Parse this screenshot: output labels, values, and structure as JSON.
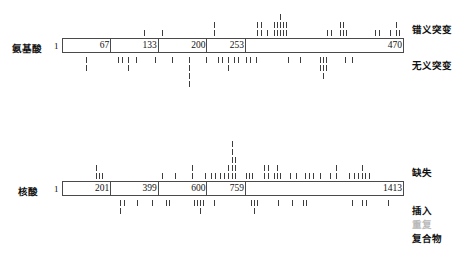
{
  "figure": {
    "title_present": false,
    "rows": [
      {
        "id": "amino-acid",
        "label": "氨基酸",
        "start_label": "1",
        "bar": {
          "x": 62,
          "y": 38,
          "width": 342,
          "height": 15
        },
        "segments": [
          {
            "end_label": "67",
            "width_pct": 14.2
          },
          {
            "end_label": "133",
            "width_pct": 14.0
          },
          {
            "end_label": "200",
            "width_pct": 14.3
          },
          {
            "end_label": "253",
            "width_pct": 11.3
          },
          {
            "end_label": "470",
            "width_pct": 46.2
          }
        ],
        "above_label": "错义突变",
        "below_label": "无义突变"
      },
      {
        "id": "nucleic-acid",
        "label": "核酸",
        "start_label": "1",
        "bar": {
          "x": 62,
          "y": 181,
          "width": 342,
          "height": 15
        },
        "segments": [
          {
            "end_label": "201",
            "width_pct": 14.2
          },
          {
            "end_label": "399",
            "width_pct": 14.0
          },
          {
            "end_label": "600",
            "width_pct": 14.3
          },
          {
            "end_label": "759",
            "width_pct": 11.3
          },
          {
            "end_label": "1413",
            "width_pct": 46.2
          }
        ],
        "above_label": "缺失",
        "below_labels": [
          "插入",
          "重复",
          "复合物"
        ]
      }
    ],
    "legend_right": [
      {
        "text": "错义突变",
        "y": 22,
        "muted": false
      },
      {
        "text": "无义突变",
        "y": 58,
        "muted": false
      },
      {
        "text": "缺失",
        "y": 165,
        "muted": false
      },
      {
        "text": "插入",
        "y": 203,
        "muted": false
      },
      {
        "text": "重复",
        "y": 218,
        "muted": true
      },
      {
        "text": "复合物",
        "y": 233,
        "muted": false
      }
    ],
    "colors": {
      "bar_border": "#4a4a4a",
      "tick": "#3d3d3d",
      "tick_pale": "#9a9a9a",
      "muted_text": "#b9b9b9",
      "text": "#111111",
      "background": "#ffffff"
    }
  },
  "chart_data": {
    "type": "lollipop",
    "title": "",
    "xlabel": "",
    "ylabel": "",
    "tracks": [
      {
        "name": "错义突变",
        "axis": "氨基酸",
        "position": "above",
        "axis_range": [
          1,
          470
        ],
        "ticks": [
          {
            "x": 144,
            "n": 1
          },
          {
            "x": 162,
            "n": 1
          },
          {
            "x": 214,
            "n": 2
          },
          {
            "x": 257,
            "n": 2
          },
          {
            "x": 261,
            "n": 2
          },
          {
            "x": 267,
            "n": 1
          },
          {
            "x": 274,
            "n": 2
          },
          {
            "x": 277,
            "n": 2
          },
          {
            "x": 280,
            "n": 3
          },
          {
            "x": 283,
            "n": 2
          },
          {
            "x": 286,
            "n": 2
          },
          {
            "x": 327,
            "n": 1
          },
          {
            "x": 331,
            "n": 1
          },
          {
            "x": 340,
            "n": 2
          },
          {
            "x": 343,
            "n": 2
          },
          {
            "x": 346,
            "n": 1
          },
          {
            "x": 375,
            "n": 1
          },
          {
            "x": 379,
            "n": 1
          },
          {
            "x": 390,
            "n": 1
          },
          {
            "x": 396,
            "n": 2
          },
          {
            "x": 399,
            "n": 1
          }
        ]
      },
      {
        "name": "无义突变",
        "axis": "氨基酸",
        "position": "below",
        "axis_range": [
          1,
          470
        ],
        "ticks": [
          {
            "x": 86,
            "n": 2
          },
          {
            "x": 118,
            "n": 1
          },
          {
            "x": 122,
            "n": 1
          },
          {
            "x": 128,
            "n": 2
          },
          {
            "x": 136,
            "n": 1
          },
          {
            "x": 155,
            "n": 1
          },
          {
            "x": 172,
            "n": 1
          },
          {
            "x": 189,
            "n": 4
          },
          {
            "x": 206,
            "n": 1
          },
          {
            "x": 218,
            "n": 1
          },
          {
            "x": 222,
            "n": 1
          },
          {
            "x": 228,
            "n": 2
          },
          {
            "x": 234,
            "n": 1
          },
          {
            "x": 238,
            "n": 1
          },
          {
            "x": 246,
            "n": 1
          },
          {
            "x": 250,
            "n": 1
          },
          {
            "x": 256,
            "n": 1
          },
          {
            "x": 288,
            "n": 1
          },
          {
            "x": 300,
            "n": 1
          },
          {
            "x": 320,
            "n": 2
          },
          {
            "x": 323,
            "n": 3
          },
          {
            "x": 326,
            "n": 2
          },
          {
            "x": 345,
            "n": 1
          },
          {
            "x": 352,
            "n": 1
          }
        ]
      },
      {
        "name": "缺失",
        "axis": "核酸",
        "position": "above",
        "axis_range": [
          1,
          1413
        ],
        "ticks": [
          {
            "x": 96,
            "n": 2
          },
          {
            "x": 99,
            "n": 1
          },
          {
            "x": 102,
            "n": 1
          },
          {
            "x": 162,
            "n": 1
          },
          {
            "x": 175,
            "n": 1
          },
          {
            "x": 192,
            "n": 2
          },
          {
            "x": 205,
            "n": 1
          },
          {
            "x": 211,
            "n": 1
          },
          {
            "x": 215,
            "n": 1
          },
          {
            "x": 220,
            "n": 1
          },
          {
            "x": 224,
            "n": 1
          },
          {
            "x": 228,
            "n": 2
          },
          {
            "x": 232,
            "n": 5
          },
          {
            "x": 235,
            "n": 3
          },
          {
            "x": 246,
            "n": 1
          },
          {
            "x": 249,
            "n": 1
          },
          {
            "x": 252,
            "n": 1
          },
          {
            "x": 264,
            "n": 2
          },
          {
            "x": 268,
            "n": 2
          },
          {
            "x": 274,
            "n": 1
          },
          {
            "x": 277,
            "n": 2
          },
          {
            "x": 280,
            "n": 1
          },
          {
            "x": 290,
            "n": 1
          },
          {
            "x": 296,
            "n": 1
          },
          {
            "x": 305,
            "n": 1
          },
          {
            "x": 309,
            "n": 1
          },
          {
            "x": 313,
            "n": 1
          },
          {
            "x": 320,
            "n": 1
          },
          {
            "x": 330,
            "n": 1
          },
          {
            "x": 336,
            "n": 2
          },
          {
            "x": 349,
            "n": 1
          },
          {
            "x": 354,
            "n": 1
          },
          {
            "x": 358,
            "n": 1
          },
          {
            "x": 362,
            "n": 2
          },
          {
            "x": 365,
            "n": 1
          },
          {
            "x": 369,
            "n": 1
          }
        ]
      },
      {
        "name": "插入",
        "axis": "核酸",
        "position": "below",
        "axis_range": [
          1,
          1413
        ],
        "ticks": [
          {
            "x": 120,
            "n": 2
          },
          {
            "x": 124,
            "n": 1
          },
          {
            "x": 137,
            "n": 1
          },
          {
            "x": 152,
            "n": 1
          },
          {
            "x": 166,
            "n": 1
          },
          {
            "x": 169,
            "n": 1
          },
          {
            "x": 194,
            "n": 1
          },
          {
            "x": 197,
            "n": 1
          },
          {
            "x": 200,
            "n": 2
          },
          {
            "x": 203,
            "n": 1
          },
          {
            "x": 214,
            "n": 1
          },
          {
            "x": 251,
            "n": 1
          },
          {
            "x": 254,
            "n": 2
          },
          {
            "x": 257,
            "n": 1
          },
          {
            "x": 278,
            "n": 1
          },
          {
            "x": 292,
            "n": 1
          },
          {
            "x": 303,
            "n": 1
          },
          {
            "x": 306,
            "n": 1
          },
          {
            "x": 352,
            "n": 1
          },
          {
            "x": 362,
            "n": 1
          },
          {
            "x": 366,
            "n": 1
          },
          {
            "x": 388,
            "n": 1
          }
        ]
      }
    ]
  }
}
